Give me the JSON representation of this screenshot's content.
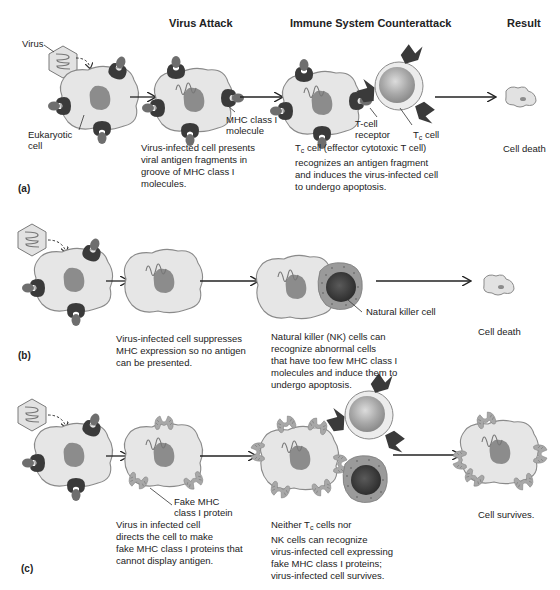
{
  "headers": {
    "virus_attack": "Virus Attack",
    "immune_counterattack": "Immune System Counterattack",
    "result": "Result"
  },
  "panels": {
    "a": {
      "label": "(a)",
      "virus_label": "Virus",
      "eukaryotic_label_1": "Eukaryotic",
      "eukaryotic_label_2": "cell",
      "mhc_label_1": "MHC class I",
      "mhc_label_2": "molecule",
      "tcell_receptor_1": "T-cell",
      "tcell_receptor_2": "receptor",
      "tc_cell_T": "T",
      "tc_cell_sub": "c",
      "tc_cell_rest": " cell",
      "attack_desc": [
        "Virus-infected cell presents",
        "viral antigen fragments in",
        "groove of MHC class I",
        "molecules."
      ],
      "counter_desc_first_T": "T",
      "counter_desc_first_sub": "c",
      "counter_desc_first_rest": " cell (effector cytotoxic T cell)",
      "counter_desc": [
        "recognizes an antigen fragment",
        "and induces the virus-infected cell",
        "to undergo apoptosis."
      ],
      "result": "Cell death"
    },
    "b": {
      "label": "(b)",
      "nk_label": "Natural killer cell",
      "attack_desc": [
        "Virus-infected cell suppresses",
        "MHC expression so no antigen",
        "can be presented."
      ],
      "counter_desc": [
        "Natural killer (NK) cells can",
        "recognize abnormal cells",
        "that have too few MHC class I",
        "molecules and induce them to",
        "undergo apoptosis."
      ],
      "result": "Cell death"
    },
    "c": {
      "label": "(c)",
      "fake_label_1": "Fake MHC",
      "fake_label_2": "class I protein",
      "attack_desc": [
        "Virus in infected cell",
        "directs the cell to make",
        "fake MHC class I proteins that",
        "cannot display antigen."
      ],
      "counter_desc_first_a": "Neither T",
      "counter_desc_first_sub": "c",
      "counter_desc_first_b": " cells nor",
      "counter_desc": [
        "NK cells can recognize",
        "virus-infected cell expressing",
        "fake MHC class I proteins;",
        "virus-infected  cell survives."
      ],
      "result": "Cell survives."
    }
  },
  "colors": {
    "cell_fill": "#e6e6e6",
    "cell_stroke": "#8a8a8a",
    "nucleus": "#8c8c8c",
    "mhc_dark": "#3a3a3a",
    "antigen": "#6e6e6e",
    "fake_mhc": "#a8a8a8",
    "tcell_outer": "#ececec",
    "tcell_inner": "#a0a0a0",
    "nk_outer": "#9a9a9a",
    "nk_inner": "#3c3c3c"
  }
}
